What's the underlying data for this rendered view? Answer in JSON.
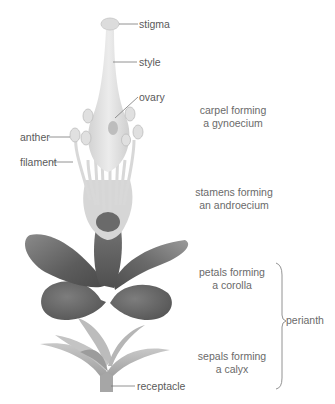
{
  "diagram": {
    "parts": {
      "stigma": "stigma",
      "style": "style",
      "ovary": "ovary",
      "anther": "anther",
      "filament": "filament",
      "receptacle": "receptacle"
    },
    "groups": {
      "carpel_line1": "carpel forming",
      "carpel_line2": "a gynoecium",
      "stamens_line1": "stamens forming",
      "stamens_line2": "an androecium",
      "petals_line1": "petals forming",
      "petals_line2": "a corolla",
      "sepals_line1": "sepals forming",
      "sepals_line2": "a calyx",
      "perianth": "perianth"
    },
    "colors": {
      "background": "#ffffff",
      "label_text": "#5a5a5a",
      "leader_line": "#777777",
      "carpel_fill": "#e2e2e2",
      "petal_dark": "#5f5f5f",
      "petal_mid": "#7c7c7c",
      "sepal_fill": "#b0b0b0"
    }
  }
}
